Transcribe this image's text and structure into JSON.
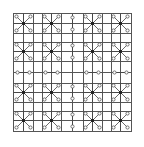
{
  "diagram": {
    "title": "",
    "width": 144,
    "height": 147,
    "colors": {
      "background": "#ffffff",
      "grid": "#555555",
      "arm": "#444444",
      "hub": "#222222",
      "end_fill": "#ffffff"
    },
    "grid_lines": [
      13,
      23,
      33,
      42,
      51,
      61,
      72,
      83,
      92,
      102,
      111,
      120,
      131
    ],
    "grid_extent": [
      13,
      131
    ],
    "motif_centers": [
      23,
      51,
      72,
      92,
      120
    ],
    "motif_layout": [
      [
        "star",
        "star",
        "vlink",
        "star",
        "star"
      ],
      [
        "star",
        "star",
        "vlink",
        "star",
        "star"
      ],
      [
        "hlink",
        "hlink",
        "empty",
        "hlink",
        "hlink"
      ],
      [
        "star",
        "star",
        "vlink",
        "star",
        "star"
      ],
      [
        "star",
        "star",
        "vlink",
        "star",
        "star"
      ]
    ],
    "star": {
      "diagonal_reach": 7,
      "orthogonal_reach": 10,
      "end_circle_radius": 1.6,
      "hub_size": 3
    },
    "link": {
      "half_length": 6,
      "end_circle_radius": 1.6
    }
  }
}
